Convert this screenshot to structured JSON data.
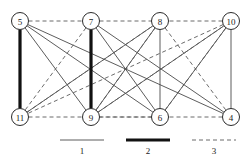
{
  "figure": {
    "title": "",
    "background_color": "#ffffff"
  },
  "graph": {
    "nodes": [
      {
        "id": "5",
        "label": "5",
        "x": 20,
        "y": 21,
        "r": 8.5,
        "row": "top"
      },
      {
        "id": "7",
        "label": "7",
        "x": 91,
        "y": 21,
        "r": 8.5,
        "row": "top"
      },
      {
        "id": "8",
        "label": "8",
        "x": 160,
        "y": 21,
        "r": 8.5,
        "row": "top"
      },
      {
        "id": "10",
        "label": "10",
        "x": 231,
        "y": 21,
        "r": 8.5,
        "row": "top"
      },
      {
        "id": "11",
        "label": "11",
        "x": 20,
        "y": 117,
        "r": 8.5,
        "row": "bottom"
      },
      {
        "id": "9",
        "label": "9",
        "x": 91,
        "y": 117,
        "r": 8.5,
        "row": "bottom"
      },
      {
        "id": "6",
        "label": "6",
        "x": 160,
        "y": 117,
        "r": 8.5,
        "row": "bottom"
      },
      {
        "id": "4",
        "label": "4",
        "x": 231,
        "y": 117,
        "r": 8.5,
        "row": "bottom"
      }
    ],
    "edges": [
      {
        "from": "5",
        "to": "11",
        "type": 2
      },
      {
        "from": "7",
        "to": "9",
        "type": 2
      },
      {
        "from": "8",
        "to": "6",
        "type": 1
      },
      {
        "from": "10",
        "to": "4",
        "type": 1
      },
      {
        "from": "5",
        "to": "9",
        "type": 1
      },
      {
        "from": "5",
        "to": "6",
        "type": 1
      },
      {
        "from": "5",
        "to": "4",
        "type": 1
      },
      {
        "from": "7",
        "to": "6",
        "type": 1
      },
      {
        "from": "7",
        "to": "4",
        "type": 1
      },
      {
        "from": "8",
        "to": "11",
        "type": 1
      },
      {
        "from": "8",
        "to": "9",
        "type": 1
      },
      {
        "from": "10",
        "to": "9",
        "type": 1
      },
      {
        "from": "10",
        "to": "6",
        "type": 1
      },
      {
        "from": "5",
        "to": "7",
        "type": 3
      },
      {
        "from": "7",
        "to": "11",
        "type": 3
      },
      {
        "from": "8",
        "to": "4",
        "type": 3
      },
      {
        "from": "10",
        "to": "11",
        "type": 3
      },
      {
        "from": "11",
        "to": "8",
        "type": 3
      },
      {
        "from": "9",
        "to": "8",
        "type": 3
      },
      {
        "from": "9",
        "to": "10",
        "type": 3
      },
      {
        "from": "9",
        "to": "4",
        "type": 3
      },
      {
        "from": "11",
        "to": "6",
        "type": 3
      },
      {
        "from": "6",
        "to": "10",
        "type": 3
      },
      {
        "from": "7",
        "to": "10",
        "type": 3
      }
    ]
  },
  "legend": {
    "items": [
      {
        "label": "1",
        "type": 1,
        "x": 82,
        "y": 140
      },
      {
        "label": "2",
        "type": 2,
        "x": 148,
        "y": 140
      },
      {
        "label": "3",
        "type": 3,
        "x": 214,
        "y": 140
      }
    ],
    "sample_width": 44
  },
  "colors": {
    "node_stroke": "#2b2b2b",
    "node_fill": "#ffffff",
    "edge_type1": "#4a4a4a",
    "edge_type2": "#111111",
    "edge_type3": "#5a5a5a",
    "text": "#1a1a1a"
  }
}
